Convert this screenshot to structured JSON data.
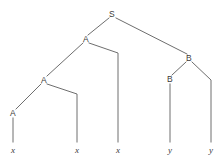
{
  "figure": {
    "type": "syntax-tree",
    "width": 223,
    "height": 157,
    "background_color": "#ffffff",
    "line_color": "#6e6e6e",
    "text_color": "#3a3a3a"
  },
  "nodes": [
    {
      "id": "S",
      "label": "S",
      "x": 112,
      "y": 14,
      "kind": "nonterminal"
    },
    {
      "id": "A1",
      "label": "A",
      "x": 86,
      "y": 39,
      "kind": "nonterminal"
    },
    {
      "id": "B1",
      "label": "B",
      "x": 189,
      "y": 58,
      "kind": "nonterminal"
    },
    {
      "id": "A2",
      "label": "A",
      "x": 44,
      "y": 80,
      "kind": "nonterminal"
    },
    {
      "id": "B2",
      "label": "B",
      "x": 170,
      "y": 79,
      "kind": "nonterminal"
    },
    {
      "id": "A3",
      "label": "A",
      "x": 13,
      "y": 113,
      "kind": "nonterminal"
    }
  ],
  "leaves": [
    {
      "id": "x1",
      "label": "x",
      "x": 13,
      "y": 150
    },
    {
      "id": "x2",
      "label": "x",
      "x": 77,
      "y": 150
    },
    {
      "id": "x3",
      "label": "x",
      "x": 118,
      "y": 150
    },
    {
      "id": "y1",
      "label": "y",
      "x": 170,
      "y": 150
    },
    {
      "id": "y2",
      "label": "y",
      "x": 211,
      "y": 150
    }
  ],
  "edges": [
    {
      "name": "S-to-A1",
      "points": "109,18 88,35"
    },
    {
      "name": "S-to-B1",
      "points": "116,18 187,54"
    },
    {
      "name": "A1-to-A2",
      "points": "83,43 47,76"
    },
    {
      "name": "A1-to-x3",
      "points": "89,43 118,53 118,142"
    },
    {
      "name": "A2-to-A3",
      "points": "41,84 16,109"
    },
    {
      "name": "A2-to-x2",
      "points": "47,84 77,94 77,142"
    },
    {
      "name": "A3-to-x1",
      "points": "13,118 13,142"
    },
    {
      "name": "B1-to-B2",
      "points": "186,62 172,75"
    },
    {
      "name": "B1-to-y2",
      "points": "192,62 211,80 211,142"
    },
    {
      "name": "B2-to-y1",
      "points": "170,84 170,142"
    }
  ]
}
